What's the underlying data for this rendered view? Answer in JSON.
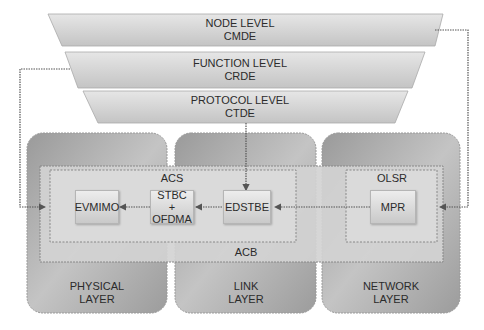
{
  "levels": [
    {
      "name": "NODE LEVEL",
      "code": "CMDE"
    },
    {
      "name": "FUNCTION LEVEL",
      "code": "CRDE"
    },
    {
      "name": "PROTOCOL LEVEL",
      "code": "CTDE"
    }
  ],
  "layers": [
    {
      "line1": "PHYSICAL",
      "line2": "LAYER"
    },
    {
      "line1": "LINK",
      "line2": "LAYER"
    },
    {
      "line1": "NETWORK",
      "line2": "LAYER"
    }
  ],
  "groups": {
    "acb": "ACB",
    "acs": "ACS",
    "olsr": "OLSR"
  },
  "nodes": {
    "evmimo": "EVMIMO",
    "stbc_line1": "STBC",
    "stbc_line2": "+",
    "stbc_line3": "OFDMA",
    "edstbe": "EDSTBE",
    "mpr": "MPR"
  },
  "colors": {
    "trapezoid_fill": "#d4d4d4",
    "layer_fill": "#a9a9a9",
    "acb_fill": "#d6d6d6",
    "node_fill": "#dcdcdc",
    "connector": "#555555"
  }
}
